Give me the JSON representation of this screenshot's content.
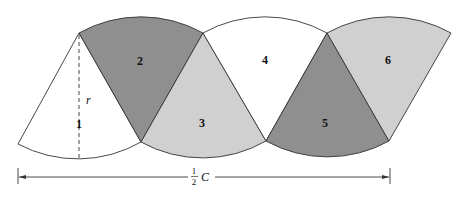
{
  "diagram": {
    "sectors": [
      {
        "label": "1",
        "fill": "#ffffff"
      },
      {
        "label": "2",
        "fill": "#8f8f8f"
      },
      {
        "label": "3",
        "fill": "#d0d0d0"
      },
      {
        "label": "4",
        "fill": "#ffffff"
      },
      {
        "label": "5",
        "fill": "#8f8f8f"
      },
      {
        "label": "6",
        "fill": "#d0d0d0"
      }
    ],
    "radius_label": "r",
    "dimension": {
      "numerator": "1",
      "denominator": "2",
      "symbol": "C"
    }
  }
}
